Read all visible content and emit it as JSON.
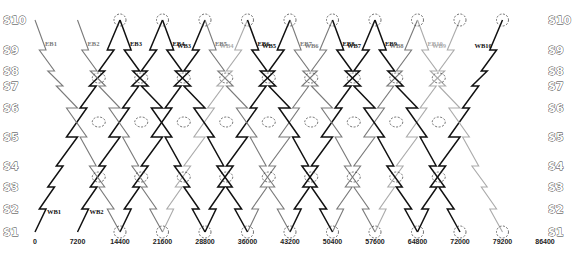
{
  "chart_data": {
    "type": "line",
    "title": "",
    "xlabel": "Time (s)",
    "ylabel": "Station",
    "xlim": [
      0,
      86400
    ],
    "x_ticks": [
      0,
      7200,
      14400,
      21600,
      28800,
      36000,
      43200,
      50400,
      57600,
      64800,
      72000,
      79200,
      86400
    ],
    "y_ticks": [
      "S1",
      "S2",
      "S3",
      "S4",
      "S5",
      "S6",
      "S7",
      "S8",
      "S9",
      "S10"
    ],
    "grid": false,
    "legend": "none (inline train labels)",
    "colors": {
      "dark": "#111111",
      "mid": "#7a7a7a",
      "light": "#ababab"
    },
    "trip_duration_s": 14400,
    "headway_s": 7200,
    "series": [
      {
        "name": "WB1",
        "direction": "WB",
        "depart": 0,
        "arrive": 14400,
        "from": "S1",
        "to": "S10",
        "shade": "dark"
      },
      {
        "name": "WB2",
        "direction": "WB",
        "depart": 7200,
        "arrive": 21600,
        "from": "S1",
        "to": "S10",
        "shade": "dark"
      },
      {
        "name": "WB3",
        "direction": "WB",
        "depart": 14400,
        "arrive": 28800,
        "from": "S1",
        "to": "S10",
        "shade": "dark"
      },
      {
        "name": "WB4",
        "direction": "WB",
        "depart": 21600,
        "arrive": 36000,
        "from": "S1",
        "to": "S10",
        "shade": "light"
      },
      {
        "name": "WB5",
        "direction": "WB",
        "depart": 28800,
        "arrive": 43200,
        "from": "S1",
        "to": "S10",
        "shade": "dark"
      },
      {
        "name": "WB6",
        "direction": "WB",
        "depart": 36000,
        "arrive": 50400,
        "from": "S1",
        "to": "S10",
        "shade": "mid"
      },
      {
        "name": "WB7",
        "direction": "WB",
        "depart": 43200,
        "arrive": 57600,
        "from": "S1",
        "to": "S10",
        "shade": "dark"
      },
      {
        "name": "WB8",
        "direction": "WB",
        "depart": 50400,
        "arrive": 64800,
        "from": "S1",
        "to": "S10",
        "shade": "mid"
      },
      {
        "name": "WB9",
        "direction": "WB",
        "depart": 57600,
        "arrive": 72000,
        "from": "S1",
        "to": "S10",
        "shade": "light"
      },
      {
        "name": "WB10",
        "direction": "WB",
        "depart": 64800,
        "arrive": 79200,
        "from": "S1",
        "to": "S10",
        "shade": "dark"
      },
      {
        "name": "EB1",
        "direction": "EB",
        "depart": 0,
        "arrive": 14400,
        "from": "S10",
        "to": "S1",
        "shade": "mid"
      },
      {
        "name": "EB2",
        "direction": "EB",
        "depart": 7200,
        "arrive": 21600,
        "from": "S10",
        "to": "S1",
        "shade": "mid"
      },
      {
        "name": "EB3",
        "direction": "EB",
        "depart": 14400,
        "arrive": 28800,
        "from": "S10",
        "to": "S1",
        "shade": "dark"
      },
      {
        "name": "EB4",
        "direction": "EB",
        "depart": 21600,
        "arrive": 36000,
        "from": "S10",
        "to": "S1",
        "shade": "dark"
      },
      {
        "name": "EB5",
        "direction": "EB",
        "depart": 28800,
        "arrive": 43200,
        "from": "S10",
        "to": "S1",
        "shade": "mid"
      },
      {
        "name": "EB6",
        "direction": "EB",
        "depart": 36000,
        "arrive": 50400,
        "from": "S10",
        "to": "S1",
        "shade": "dark"
      },
      {
        "name": "EB7",
        "direction": "EB",
        "depart": 43200,
        "arrive": 57600,
        "from": "S10",
        "to": "S1",
        "shade": "mid"
      },
      {
        "name": "EB8",
        "direction": "EB",
        "depart": 50400,
        "arrive": 64800,
        "from": "S10",
        "to": "S1",
        "shade": "dark"
      },
      {
        "name": "EB9",
        "direction": "EB",
        "depart": 57600,
        "arrive": 72000,
        "from": "S10",
        "to": "S1",
        "shade": "dark"
      },
      {
        "name": "EB10",
        "direction": "EB",
        "depart": 64800,
        "arrive": 79200,
        "from": "S10",
        "to": "S1",
        "shade": "light"
      }
    ],
    "annotations": "Dashed ellipses mark train meets/crossings at S10, between S8-S7, between S6-S5, between S4-S3, and at S1"
  }
}
